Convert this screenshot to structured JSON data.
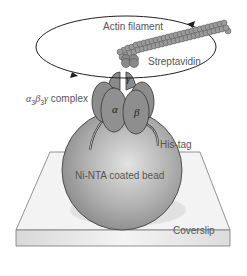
{
  "diagram": {
    "type": "schematic",
    "labels": {
      "actin": "Actin filament",
      "streptavidin": "Streptavidin",
      "complex_alpha": "α",
      "complex_sub3a": "3",
      "complex_beta": "β",
      "complex_sub3b": "3",
      "complex_gamma": "γ",
      "complex_word": " complex",
      "subunit_alpha": "α",
      "subunit_beta": "β",
      "subunit_gamma": "γ",
      "histag": "His-tag",
      "bead": "Ni-NTA coated bead",
      "coverslip": "Coverslip"
    },
    "colors": {
      "protein": "#8c8c8c",
      "bead": "#a9a9a9",
      "coverslip": "#f0f0f0",
      "outline": "#333333",
      "text": "#555555"
    },
    "rotation_direction": "counterclockwise"
  }
}
